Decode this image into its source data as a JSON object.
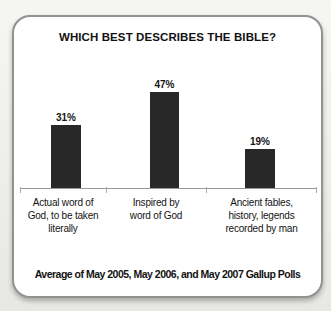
{
  "chart_data": {
    "type": "bar",
    "title": "WHICH BEST DESCRIBES THE BIBLE?",
    "categories": [
      "Actual word of God, to be taken literally",
      "Inspired by word of God",
      "Ancient fables, history, legends recorded by man"
    ],
    "category_lines": [
      [
        "Actual word of",
        "God, to be taken",
        "literally"
      ],
      [
        "Inspired by",
        "word of God"
      ],
      [
        "Ancient fables,",
        "history, legends",
        "recorded by man"
      ]
    ],
    "values": [
      31,
      47,
      19
    ],
    "value_labels": [
      "31%",
      "47%",
      "19%"
    ],
    "unit": "%",
    "ylim": [
      0,
      50
    ],
    "grid": false,
    "legend": false,
    "bar_color": "#282828",
    "axis_color": "#9a9a9a",
    "source_note": "Average of May 2005, May 2006, and May 2007 Gallup Polls"
  }
}
